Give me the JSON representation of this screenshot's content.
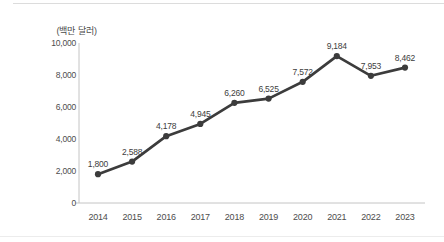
{
  "chart_data": {
    "type": "line",
    "title": "",
    "ylabel": "(백만 달러)",
    "xlabel": "",
    "categories": [
      "2014",
      "2015",
      "2016",
      "2017",
      "2018",
      "2019",
      "2020",
      "2021",
      "2022",
      "2023"
    ],
    "values": [
      1800,
      2588,
      4178,
      4945,
      6260,
      6525,
      7572,
      9184,
      7953,
      8462
    ],
    "value_labels": [
      "1,800",
      "2,588",
      "4,178",
      "4,945",
      "6,260",
      "6,525",
      "7,572",
      "9,184",
      "7,953",
      "8,462"
    ],
    "ylim": [
      0,
      10000
    ],
    "ytick_interval": 2000,
    "ytick_labels": [
      "0",
      "2,000",
      "4,000",
      "6,000",
      "8,000",
      "10,000"
    ],
    "grid": false,
    "legend": "none",
    "line_color": "#3c3c3c",
    "marker": "circle",
    "marker_color": "#3c3c3c",
    "axis_color": "#c4c4c4"
  }
}
